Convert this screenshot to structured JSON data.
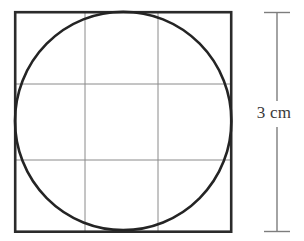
{
  "figure": {
    "background_color": "#ffffff",
    "width": 304,
    "height": 241
  },
  "square": {
    "name": "outer-square",
    "x": 15.2,
    "y": 12.2,
    "side": 216,
    "stroke_color": "#2b2b2b",
    "stroke_width": 2.6,
    "fill": "none"
  },
  "circle": {
    "name": "inscribed-circle",
    "cx": 123.2,
    "cy": 120.7,
    "r": 108.4,
    "stroke_color": "#242424",
    "stroke_width": 2.6,
    "fill": "none"
  },
  "grid": {
    "stroke_color": "#8a8a8a",
    "stroke_width": 1,
    "vertical_lines_x": [
      85,
      158
    ],
    "horizontal_lines_y": [
      84,
      160
    ]
  },
  "dimension": {
    "name": "height-dimension",
    "label": "3 cm",
    "value": 3,
    "unit": "cm",
    "line_x": 277,
    "line_top_y": 12,
    "line_bottom_y": 232,
    "cap_half_width": 13,
    "stroke_color": "#7d7d7d",
    "text_color": "#3a3a3a",
    "gap_top_y": 100,
    "gap_bottom_y": 128
  }
}
